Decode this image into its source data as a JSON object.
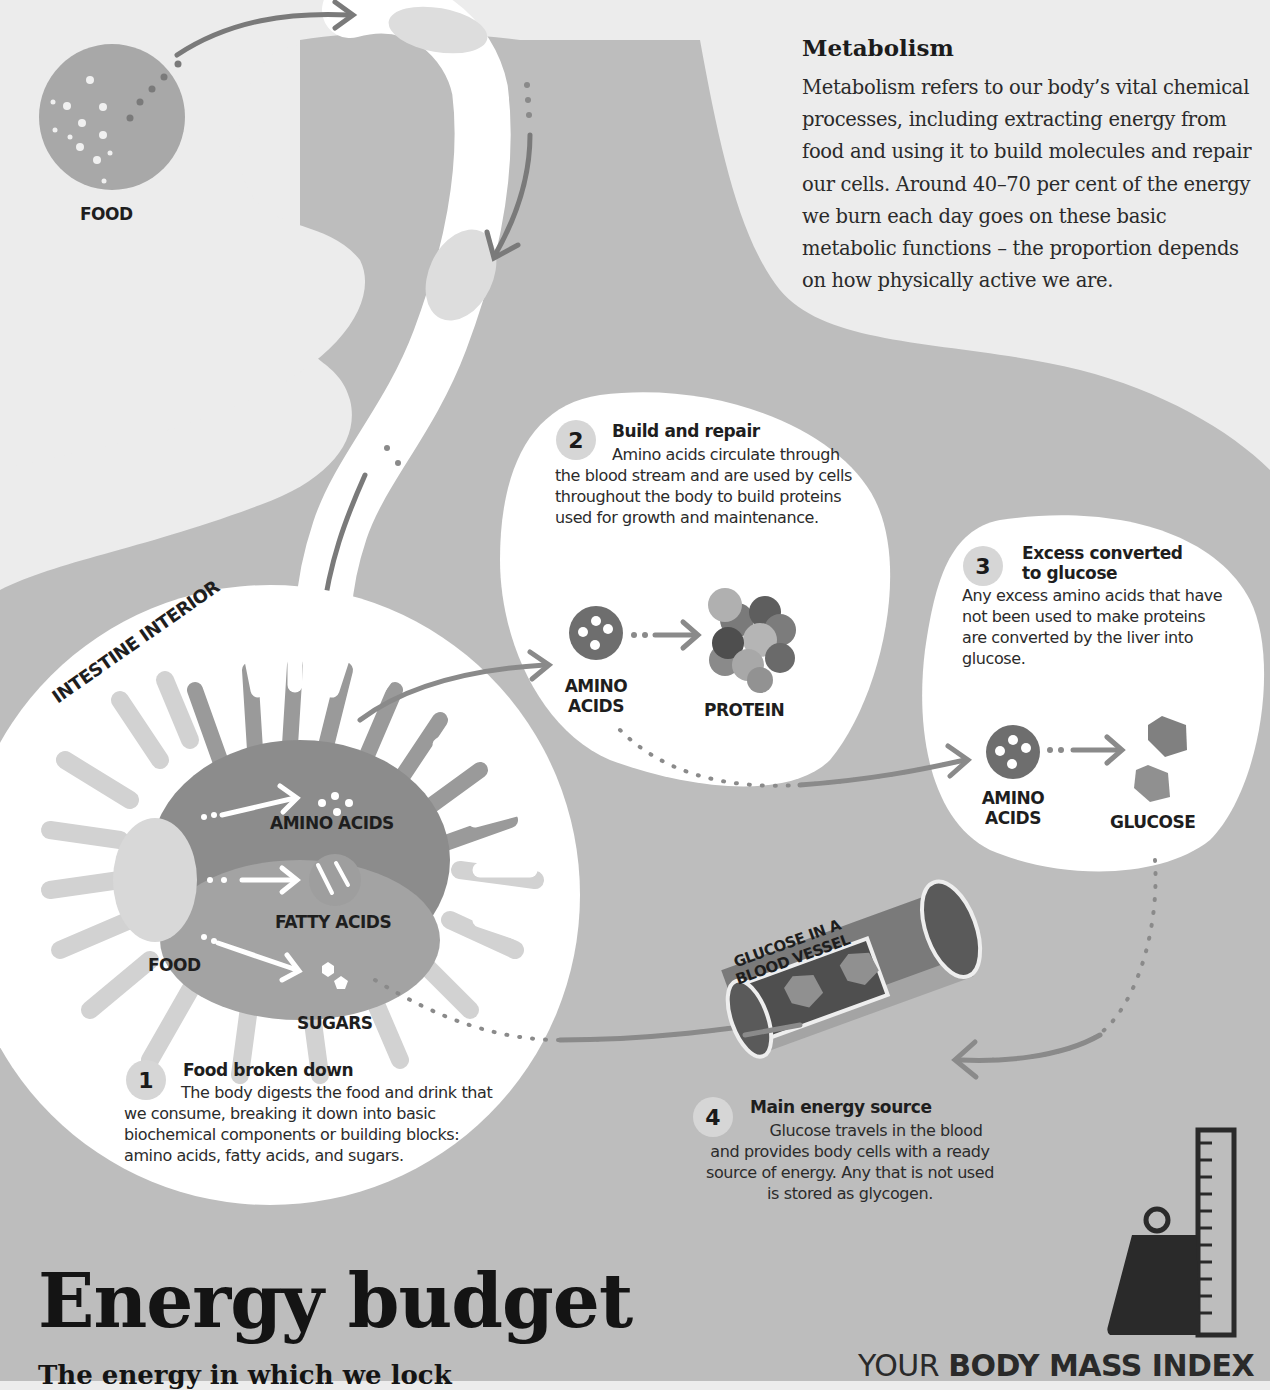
{
  "food_top": {
    "label": "FOOD"
  },
  "metabolism": {
    "title": "Metabolism",
    "body": "Metabolism refers to our body’s vital chemical processes, including extracting energy from food and using it to build molecules and repair our cells. Around 40–70 per cent of the energy we burn each day goes on these basic metabolic functions – the proportion depends on how physically active we are."
  },
  "intestine": {
    "title": "INTESTINE INTERIOR",
    "labels": {
      "amino": "AMINO ACIDS",
      "fatty": "FATTY ACIDS",
      "food": "FOOD",
      "sugars": "SUGARS"
    }
  },
  "steps": [
    {
      "num": "1",
      "title": "Food broken down",
      "body": "The body digests the food and drink that we consume, breaking it down into basic biochemical components or building blocks: amino acids, fatty acids, and sugars."
    },
    {
      "num": "2",
      "title": "Build and repair",
      "body": "Amino acids circulate through the blood stream and are used by cells throughout the body to build proteins used for growth and maintenance.",
      "left_label_1": "AMINO",
      "left_label_2": "ACIDS",
      "right_label": "PROTEIN"
    },
    {
      "num": "3",
      "title_1": "Excess converted",
      "title_2": "to glucose",
      "body": "Any excess amino acids that have not been used to make proteins are converted by the liver into glucose.",
      "left_label_1": "AMINO",
      "left_label_2": "ACIDS",
      "right_label": "GLUCOSE"
    },
    {
      "num": "4",
      "title": "Main energy source",
      "body": "Glucose travels in the blood and provides body cells with a ready source of energy. Any that is not used is stored as glycogen."
    }
  ],
  "vessel": {
    "label_1": "GLUCOSE IN A",
    "label_2": "BLOOD VESSEL"
  },
  "footer": {
    "title": "Energy budget",
    "subline": "The energy in which we lock",
    "bmi_prefix": "YOUR ",
    "bmi_strong": "BODY MASS INDEX"
  },
  "colors": {
    "background": "#ececec",
    "body_gray": "#bdbdbd",
    "dark_gray": "#6e6e6e",
    "mid_gray": "#9a9a9a",
    "white": "#ffffff"
  }
}
